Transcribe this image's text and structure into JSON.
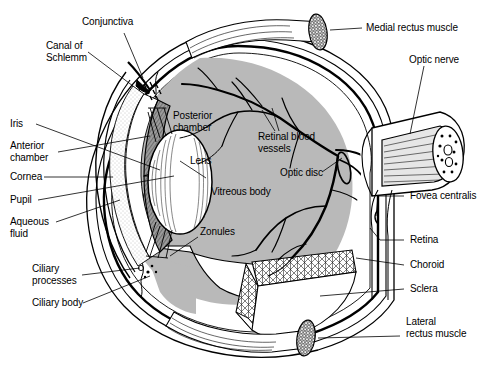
{
  "figure": {
    "type": "anatomical-diagram",
    "width": 484,
    "height": 377,
    "background_color": "#ffffff",
    "line_color": "#000000",
    "vitreous_fill": "#b9b9b9",
    "sclera_fill": "#ffffff",
    "choroid_fill": "#d8d8d8",
    "iris_fill": "#9a9a9a",
    "lens_fill": "#ffffff",
    "aqueous_fill": "#ededed",
    "muscle_fill": "#e8e8e8"
  },
  "labels": {
    "conjunctiva": "Conjunctiva",
    "canal_of_schlemm": "Canal of\nSchlemm",
    "iris": "Iris",
    "anterior_chamber": "Anterior\nchamber",
    "cornea": "Cornea",
    "pupil": "Pupil",
    "aqueous_fluid": "Aqueous\nfluid",
    "ciliary_processes": "Ciliary\nprocesses",
    "ciliary_body": "Ciliary body",
    "posterior_chamber": "Posterior\nchamber",
    "lens": "Lens",
    "vitreous_body": "Vitreous body",
    "zonules": "Zonules",
    "retinal_blood_vessels": "Retinal blood\nvessels",
    "optic_disc": "Optic disc",
    "medial_rectus_muscle": "Medial rectus muscle",
    "optic_nerve": "Optic nerve",
    "fovea_centralis": "Fovea centralis",
    "retina": "Retina",
    "choroid": "Choroid",
    "sclera": "Sclera",
    "lateral_rectus_muscle": "Lateral\nrectus muscle"
  }
}
